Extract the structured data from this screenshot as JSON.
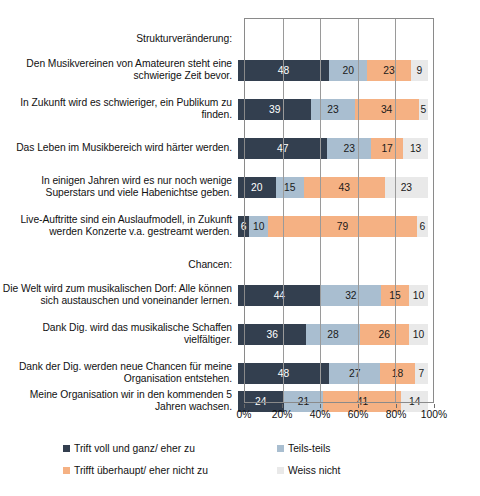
{
  "chart_data": {
    "type": "bar",
    "orientation": "horizontal",
    "stacked": true,
    "normalized": "100%",
    "title": "",
    "xlabel": "",
    "ylabel": "",
    "xlim": [
      0,
      100
    ],
    "xticks": [
      "0%",
      "20%",
      "40%",
      "60%",
      "80%",
      "100%"
    ],
    "xtick_values": [
      0,
      20,
      40,
      60,
      80,
      100
    ],
    "grid": true,
    "legend_position": "bottom",
    "series": [
      {
        "name": "Trift voll und ganz/ eher zu",
        "color": "#333f4f",
        "values": [
          48,
          39,
          47,
          20,
          6,
          44,
          36,
          48,
          24
        ]
      },
      {
        "name": "Teils-teils",
        "color": "#a9bed0",
        "values": [
          20,
          23,
          23,
          15,
          10,
          32,
          28,
          27,
          21
        ]
      },
      {
        "name": "Trifft überhaupt/ eher nicht zu",
        "color": "#f5b183",
        "values": [
          23,
          34,
          17,
          43,
          79,
          15,
          26,
          18,
          41
        ]
      },
      {
        "name": "Weiss nicht",
        "color": "#e9e9e9",
        "values": [
          9,
          5,
          13,
          23,
          6,
          10,
          10,
          7,
          14
        ]
      }
    ],
    "categories": [
      "Den Musikvereinen von Amateuren steht eine schwierige Zeit bevor.",
      "In Zukunft wird es schwieriger, ein Publikum zu finden.",
      "Das Leben im Musikbereich wird härter werden.",
      "In einigen Jahren wird es nur noch wenige Superstars und viele Habenichtse geben.",
      "Live-Auftritte sind ein Auslaufmodell, in Zukunft werden Konzerte v.a. gestreamt werden.",
      "Die Welt wird zum musikalischen Dorf: Alle können sich austauschen und voneinander lernen.",
      "Dank Dig. wird das musikalische Schaffen vielfältiger.",
      "Dank der Dig. werden neue Chancen für meine Organisation entstehen.",
      "Meine Organisation wir in den kommenden 5 Jahren wachsen."
    ],
    "group_headers": [
      "Strukturveränderung:",
      "Chancen:"
    ]
  },
  "rows": [
    {
      "label": "Strukturveränderung:",
      "header": true,
      "top": 4,
      "height": 34,
      "values": []
    },
    {
      "label": "Den Musikvereinen von Amateuren steht eine schwierige Zeit bevor.",
      "header": false,
      "top": 35,
      "height": 34,
      "values": [
        48,
        20,
        23,
        9
      ]
    },
    {
      "label": "In Zukunft wird es schwieriger, ein Publikum zu finden.",
      "header": false,
      "top": 74,
      "height": 34,
      "values": [
        39,
        23,
        34,
        5
      ]
    },
    {
      "label": "Das Leben im Musikbereich wird härter werden.",
      "header": false,
      "top": 113,
      "height": 34,
      "values": [
        47,
        23,
        17,
        13
      ]
    },
    {
      "label": "In einigen Jahren wird es nur noch wenige Superstars und viele Habenichtse geben.",
      "header": false,
      "top": 152,
      "height": 34,
      "values": [
        20,
        15,
        43,
        23
      ]
    },
    {
      "label": "Live-Auftritte sind ein Auslaufmodell, in Zukunft werden Konzerte v.a. gestreamt werden.",
      "header": false,
      "top": 191,
      "height": 34,
      "values": [
        6,
        10,
        79,
        6
      ]
    },
    {
      "label": "Chancen:",
      "header": true,
      "top": 230,
      "height": 34,
      "values": []
    },
    {
      "label": "Die Welt wird zum musikalischen Dorf: Alle können sich austauschen und voneinander lernen.",
      "header": false,
      "top": 260,
      "height": 34,
      "values": [
        44,
        32,
        15,
        10
      ]
    },
    {
      "label": "Dank Dig. wird das musikalische Schaffen vielfältiger.",
      "header": false,
      "top": 299,
      "height": 34,
      "values": [
        36,
        28,
        26,
        10
      ]
    },
    {
      "label": "Dank der Dig. werden neue Chancen für meine Organisation entstehen.",
      "header": false,
      "top": 338,
      "height": 34,
      "values": [
        48,
        27,
        18,
        7
      ]
    },
    {
      "label": "Meine Organisation wir in den kommenden 5 Jahren wachsen.",
      "header": false,
      "top": 366,
      "height": 34,
      "values": [
        24,
        21,
        41,
        14
      ]
    }
  ],
  "axis": {
    "ticks": [
      "0%",
      "20%",
      "40%",
      "60%",
      "80%",
      "100%"
    ],
    "tick_positions": [
      0,
      20,
      40,
      60,
      80,
      100
    ]
  },
  "legend": {
    "items": [
      {
        "label": "Trift voll und ganz/ eher zu",
        "color": "#333f4f"
      },
      {
        "label": "Teils-teils",
        "color": "#a9bed0"
      },
      {
        "label": "Trifft überhaupt/ eher nicht zu",
        "color": "#f5b183"
      },
      {
        "label": "Weiss nicht",
        "color": "#e9e9e9"
      }
    ]
  },
  "colors": {
    "series_0": "#333f4f",
    "series_1": "#a9bed0",
    "series_2": "#f5b183",
    "series_3": "#e9e9e9",
    "frame": "#8a8a8a",
    "grid": "#9a9a9a",
    "background": "#ffffff",
    "text": "#111111"
  }
}
